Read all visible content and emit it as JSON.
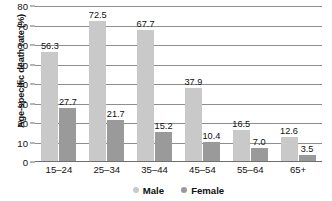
{
  "chart_data": {
    "type": "bar",
    "title": "",
    "xlabel": "",
    "ylabel": "Age-specific death rate (%)",
    "ylim": [
      0,
      80
    ],
    "ytick_step": 10,
    "yticks": [
      80,
      70,
      60,
      50,
      40,
      30,
      20,
      10,
      0
    ],
    "grid": true,
    "legend_position": "bottom",
    "categories": [
      "15–24",
      "25–34",
      "35–44",
      "45–54",
      "55–64",
      "65+"
    ],
    "series": [
      {
        "name": "Male",
        "color": "#c9c9c9",
        "values": [
          56.3,
          72.5,
          67.7,
          37.9,
          16.5,
          12.6
        ],
        "labels": [
          "56.3",
          "72.5",
          "67.7",
          "37.9",
          "16.5",
          "12.6"
        ]
      },
      {
        "name": "Female",
        "color": "#9a9a9a",
        "values": [
          27.7,
          21.7,
          15.2,
          10.4,
          7.0,
          3.5
        ],
        "labels": [
          "27.7",
          "21.7",
          "15.2",
          "10.4",
          "7.0",
          "3.5"
        ]
      }
    ]
  },
  "colors": {
    "male": "#c9c9c9",
    "female": "#9a9a9a",
    "gridline": "#8e8e8e",
    "axis": "#6f6f6f",
    "text": "#111111",
    "background": "#ffffff"
  }
}
